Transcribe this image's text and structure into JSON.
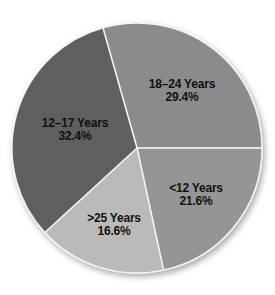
{
  "chart_data": {
    "type": "pie",
    "title": "",
    "categories": [
      "18–24 Years",
      "<12 Years",
      ">25 Years",
      "12–17 Years"
    ],
    "values": [
      29.4,
      21.6,
      16.6,
      32.4
    ],
    "unit": "%",
    "start_angle_deg": -105.84,
    "direction": "clockwise",
    "legend": "none (labels inside slices)",
    "slices": [
      {
        "label": "18–24 Years",
        "value": 29.4,
        "value_text": "29.4%",
        "color": "#8b8b8b",
        "label_pos": [
          182,
          91
        ]
      },
      {
        "label": "<12 Years",
        "value": 21.6,
        "value_text": "21.6%",
        "color": "#959595",
        "label_pos": [
          196,
          195
        ]
      },
      {
        "label": ">25 Years",
        "value": 16.6,
        "value_text": "16.6%",
        "color": "#bababa",
        "label_pos": [
          114,
          225
        ]
      },
      {
        "label": "12–17 Years",
        "value": 32.4,
        "value_text": "32.4%",
        "color": "#5f5f5f",
        "label_pos": [
          75,
          130
        ]
      }
    ],
    "geometry": {
      "cx": 137,
      "cy": 148,
      "r": 125
    }
  }
}
